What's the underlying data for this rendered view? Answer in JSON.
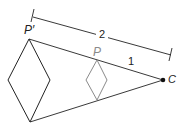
{
  "diagram": {
    "type": "dilation",
    "colors": {
      "image": "#222222",
      "preimage": "#8a8a8a",
      "background": "#ffffff"
    },
    "labels": {
      "image_point": "P′",
      "preimage_point": "P",
      "center": "C",
      "scale_full": "2",
      "scale_partial": "1"
    },
    "points": {
      "P_prime": [
        29,
        39
      ],
      "P": [
        97,
        60
      ],
      "C": [
        163,
        80
      ]
    },
    "image_rhombus": [
      [
        29,
        39
      ],
      [
        50,
        80
      ],
      [
        30,
        122
      ],
      [
        8,
        80
      ]
    ],
    "preimage_rhombus": [
      [
        97,
        60
      ],
      [
        107,
        80
      ],
      [
        97,
        100
      ],
      [
        86,
        80
      ]
    ]
  }
}
